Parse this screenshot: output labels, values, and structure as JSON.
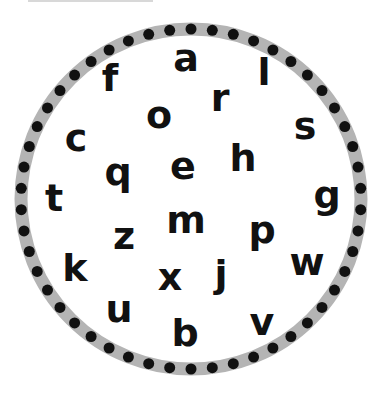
{
  "ring": {
    "center": [
      191,
      199
    ],
    "radius": 170,
    "band_width": 13,
    "band_color": "#b4b4b4",
    "dot_color": "#111111",
    "dot_radius": 5.5,
    "dot_count": 50
  },
  "letters": [
    {
      "char": "a",
      "x": 186,
      "y": 58
    },
    {
      "char": "f",
      "x": 110,
      "y": 78
    },
    {
      "char": "l",
      "x": 264,
      "y": 72
    },
    {
      "char": "r",
      "x": 220,
      "y": 98
    },
    {
      "char": "o",
      "x": 159,
      "y": 115
    },
    {
      "char": "c",
      "x": 76,
      "y": 138
    },
    {
      "char": "s",
      "x": 305,
      "y": 126
    },
    {
      "char": "q",
      "x": 118,
      "y": 172
    },
    {
      "char": "e",
      "x": 183,
      "y": 166
    },
    {
      "char": "h",
      "x": 243,
      "y": 158
    },
    {
      "char": "t",
      "x": 54,
      "y": 198
    },
    {
      "char": "g",
      "x": 327,
      "y": 195
    },
    {
      "char": "z",
      "x": 124,
      "y": 236
    },
    {
      "char": "m",
      "x": 186,
      "y": 220
    },
    {
      "char": "p",
      "x": 262,
      "y": 230
    },
    {
      "char": "k",
      "x": 75,
      "y": 268
    },
    {
      "char": "x",
      "x": 170,
      "y": 277
    },
    {
      "char": "j",
      "x": 221,
      "y": 274
    },
    {
      "char": "w",
      "x": 307,
      "y": 262
    },
    {
      "char": "u",
      "x": 119,
      "y": 309
    },
    {
      "char": "b",
      "x": 185,
      "y": 333
    },
    {
      "char": "v",
      "x": 262,
      "y": 322
    }
  ]
}
